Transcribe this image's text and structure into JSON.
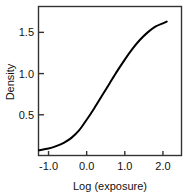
{
  "chart_data": {
    "type": "line",
    "title": "",
    "xlabel": "Log (exposure)",
    "ylabel": "Density",
    "xlim": [
      -1.25,
      2.5
    ],
    "ylim": [
      0.0,
      1.82
    ],
    "grid": false,
    "legend": null,
    "xticks": [
      -1.0,
      0.0,
      1.0,
      2.0
    ],
    "xtick_labels": [
      "-1.0",
      "0.0",
      "1.0",
      "2.0"
    ],
    "yticks": [
      0.5,
      1.0,
      1.5
    ],
    "ytick_labels": [
      "0.5",
      "1.0",
      "1.5"
    ],
    "series": [
      {
        "name": "characteristic curve",
        "color": "#000000",
        "x": [
          -1.25,
          -1.0,
          -0.8,
          -0.6,
          -0.4,
          -0.2,
          0.0,
          0.2,
          0.4,
          0.6,
          0.8,
          1.0,
          1.2,
          1.4,
          1.6,
          1.8,
          2.0,
          2.1
        ],
        "y": [
          0.07,
          0.09,
          0.12,
          0.16,
          0.22,
          0.31,
          0.44,
          0.58,
          0.73,
          0.88,
          1.03,
          1.17,
          1.3,
          1.41,
          1.5,
          1.57,
          1.61,
          1.63
        ]
      }
    ]
  },
  "axes": {
    "x_axis_label": "Log (exposure)",
    "y_axis_label": "Density",
    "x_tick_labels": [
      "-1.0",
      "0.0",
      "1.0",
      "2.0"
    ],
    "y_tick_labels": [
      "0.5",
      "1.0",
      "1.5"
    ]
  },
  "colors": {
    "curve": "#000000",
    "frame": "#333333",
    "background": "#ffffff",
    "text": "#111111"
  }
}
